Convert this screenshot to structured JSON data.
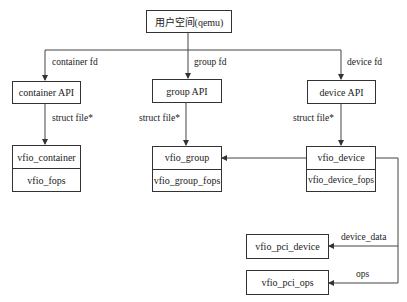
{
  "diagram": {
    "type": "flow",
    "colors": {
      "line": "#444444",
      "border": "#333333",
      "background": "#ffffff"
    },
    "nodes": {
      "top": {
        "label": "用户空间(qemu)"
      },
      "container_api": {
        "label": "container API"
      },
      "group_api": {
        "label": "group API"
      },
      "device_api": {
        "label": "device API"
      },
      "vfio_container": {
        "rows": [
          "vfio_container",
          "vfio_fops"
        ]
      },
      "vfio_group": {
        "rows": [
          "vfio_group",
          "vfio_group_fops"
        ]
      },
      "vfio_device": {
        "rows": [
          "vfio_device",
          "vfio_device_fops"
        ]
      },
      "vfio_pci_device": {
        "label": "vfio_pci_device"
      },
      "vfio_pci_ops": {
        "label": "vfio_pci_ops"
      }
    },
    "edges": [
      {
        "from": "top",
        "to": "container_api",
        "label": "container fd"
      },
      {
        "from": "top",
        "to": "group_api",
        "label": "group fd"
      },
      {
        "from": "top",
        "to": "device_api",
        "label": "device fd"
      },
      {
        "from": "container_api",
        "to": "vfio_container",
        "label": "struct file*"
      },
      {
        "from": "group_api",
        "to": "vfio_group",
        "label": "struct file*"
      },
      {
        "from": "device_api",
        "to": "vfio_device",
        "label": "struct file*"
      },
      {
        "from": "vfio_device",
        "to": "vfio_group",
        "label": ""
      },
      {
        "from": "vfio_device",
        "to": "vfio_pci_device",
        "label": "device_data"
      },
      {
        "from": "vfio_device",
        "to": "vfio_pci_ops",
        "label": "ops"
      }
    ]
  }
}
